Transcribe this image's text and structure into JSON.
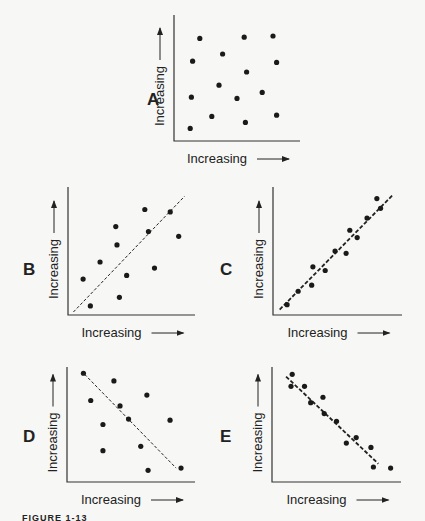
{
  "figure": {
    "caption": "FIGURE 1-13",
    "panels": [
      {
        "label": "A",
        "xlabel": "Increasing",
        "ylabel": "Increasing",
        "trend": "none"
      },
      {
        "label": "B",
        "xlabel": "Increasing",
        "ylabel": "Increasing",
        "trend": "weak positive"
      },
      {
        "label": "C",
        "xlabel": "Increasing",
        "ylabel": "Increasing",
        "trend": "strong positive"
      },
      {
        "label": "D",
        "xlabel": "Increasing",
        "ylabel": "Increasing",
        "trend": "weak negative"
      },
      {
        "label": "E",
        "xlabel": "Increasing",
        "ylabel": "Increasing",
        "trend": "strong negative"
      }
    ]
  },
  "chart_data": [
    {
      "type": "scatter",
      "title": "A",
      "xlabel": "Increasing",
      "ylabel": "Increasing",
      "xlim": [
        0,
        100
      ],
      "ylim": [
        0,
        100
      ],
      "grid": false,
      "trendline": null,
      "points": [
        [
          19,
          83
        ],
        [
          56,
          84
        ],
        [
          80,
          85
        ],
        [
          13,
          64
        ],
        [
          38,
          70
        ],
        [
          83,
          63
        ],
        [
          58,
          55
        ],
        [
          35,
          44
        ],
        [
          12,
          34
        ],
        [
          50,
          33
        ],
        [
          71,
          38
        ],
        [
          29,
          18
        ],
        [
          57,
          13
        ],
        [
          83,
          19
        ],
        [
          11,
          8
        ]
      ]
    },
    {
      "type": "scatter",
      "title": "B",
      "xlabel": "Increasing",
      "ylabel": "Increasing",
      "xlim": [
        0,
        100
      ],
      "ylim": [
        0,
        100
      ],
      "grid": false,
      "trendline": {
        "style": "dashed",
        "from": [
          2,
          0
        ],
        "to": [
          94,
          95
        ]
      },
      "points": [
        [
          61,
          84
        ],
        [
          82,
          82
        ],
        [
          37,
          70
        ],
        [
          64,
          66
        ],
        [
          89,
          62
        ],
        [
          38,
          55
        ],
        [
          24,
          41
        ],
        [
          10,
          27
        ],
        [
          69,
          36
        ],
        [
          46,
          30
        ],
        [
          40,
          12
        ],
        [
          16,
          5
        ]
      ]
    },
    {
      "type": "scatter",
      "title": "C",
      "xlabel": "Increasing",
      "ylabel": "Increasing",
      "xlim": [
        0,
        100
      ],
      "ylim": [
        0,
        100
      ],
      "grid": false,
      "trendline": {
        "style": "dashed",
        "from": [
          3,
          2
        ],
        "to": [
          95,
          96
        ]
      },
      "points": [
        [
          82,
          93
        ],
        [
          85,
          85
        ],
        [
          74,
          77
        ],
        [
          60,
          67
        ],
        [
          66,
          61
        ],
        [
          48,
          50
        ],
        [
          57,
          48
        ],
        [
          30,
          37
        ],
        [
          40,
          34
        ],
        [
          29,
          22
        ],
        [
          18,
          17
        ],
        [
          9,
          6
        ]
      ]
    },
    {
      "type": "scatter",
      "title": "D",
      "xlabel": "Increasing",
      "ylabel": "Increasing",
      "xlim": [
        0,
        100
      ],
      "ylim": [
        0,
        100
      ],
      "grid": false,
      "trendline": {
        "style": "dashed",
        "from": [
          12,
          96
        ],
        "to": [
          87,
          10
        ]
      },
      "points": [
        [
          11,
          97
        ],
        [
          36,
          90
        ],
        [
          63,
          77
        ],
        [
          17,
          72
        ],
        [
          41,
          67
        ],
        [
          48,
          55
        ],
        [
          82,
          54
        ],
        [
          27,
          50
        ],
        [
          58,
          30
        ],
        [
          27,
          26
        ],
        [
          64,
          8
        ],
        [
          91,
          10
        ]
      ]
    },
    {
      "type": "scatter",
      "title": "E",
      "xlabel": "Increasing",
      "ylabel": "Increasing",
      "xlim": [
        0,
        100
      ],
      "ylim": [
        0,
        100
      ],
      "grid": false,
      "trendline": {
        "style": "dashed",
        "from": [
          9,
          94
        ],
        "to": [
          84,
          14
        ]
      },
      "points": [
        [
          14,
          96
        ],
        [
          13,
          85
        ],
        [
          24,
          85
        ],
        [
          39,
          75
        ],
        [
          29,
          70
        ],
        [
          40,
          60
        ],
        [
          50,
          53
        ],
        [
          66,
          38
        ],
        [
          58,
          33
        ],
        [
          78,
          29
        ],
        [
          80,
          11
        ],
        [
          94,
          10
        ]
      ]
    }
  ]
}
